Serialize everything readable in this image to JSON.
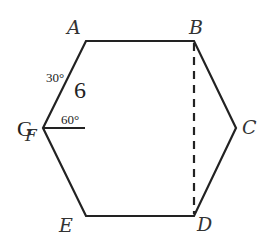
{
  "diagram": {
    "vertices": [
      {
        "name": "A",
        "x": 86,
        "y": 41
      },
      {
        "name": "B",
        "x": 194,
        "y": 41
      },
      {
        "name": "C",
        "x": 236,
        "y": 128
      },
      {
        "name": "D",
        "x": 194,
        "y": 216
      },
      {
        "name": "E",
        "x": 86,
        "y": 216
      },
      {
        "name": "G",
        "x": 43,
        "y": 128
      }
    ],
    "labels": {
      "A": "A",
      "B": "B",
      "C": "C",
      "D": "D",
      "E": "E",
      "G": "G",
      "F": "F"
    },
    "side_length": "6",
    "angle_top": "30°",
    "angle_bottom": "60°",
    "dashed_segment": "BD",
    "colors": {
      "stroke": "#222222",
      "label": "#333333"
    }
  }
}
